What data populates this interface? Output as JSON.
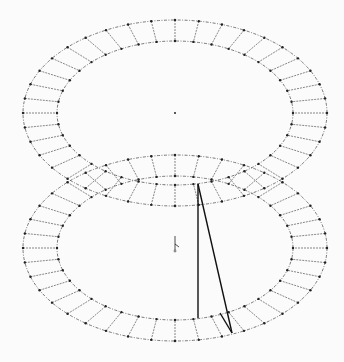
{
  "figure": {
    "type": "two stacked elliptical ring meshes with connecting line segments",
    "colors": {
      "background": "#fbfbfb",
      "mesh": "#555555",
      "node": "#222222",
      "bold_line": "#111111"
    },
    "rings": [
      {
        "name": "upper-ring",
        "cx": 175,
        "cy": 113,
        "outer_rx": 152,
        "outer_ry": 93,
        "inner_rx": 118,
        "inner_ry": 72,
        "segments": 40
      },
      {
        "name": "lower-ring",
        "cx": 175,
        "cy": 248,
        "outer_rx": 152,
        "outer_ry": 93,
        "inner_rx": 118,
        "inner_ry": 72,
        "segments": 40
      }
    ],
    "centers": [
      {
        "name": "upper-center-mark",
        "x": 175,
        "y": 113
      },
      {
        "name": "lower-center-axis",
        "x": 175,
        "y": 244
      }
    ],
    "bold_lines": [
      {
        "x1": 198,
        "y1": 184,
        "x2": 198,
        "y2": 318
      },
      {
        "x1": 198,
        "y1": 184,
        "x2": 232,
        "y2": 333
      },
      {
        "x1": 220,
        "y1": 313,
        "x2": 232,
        "y2": 333
      }
    ]
  }
}
